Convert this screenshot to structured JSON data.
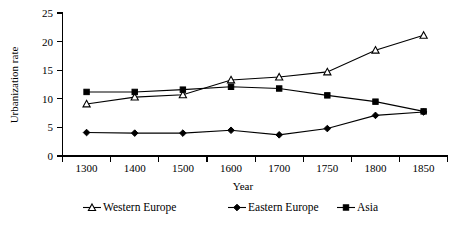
{
  "chart_data": {
    "type": "line",
    "title": "",
    "xlabel": "Year",
    "ylabel": "Urbanization rate",
    "categories": [
      "1300",
      "1400",
      "1500",
      "1600",
      "1700",
      "1750",
      "1800",
      "1850"
    ],
    "ylim": [
      0,
      25
    ],
    "yticks": [
      "0",
      "5",
      "10",
      "15",
      "20",
      "25"
    ],
    "grid": false,
    "legend_position": "bottom",
    "series": [
      {
        "name": "Western Europe",
        "marker": "open-triangle",
        "color": "#000000",
        "values": [
          9.1,
          10.3,
          10.7,
          13.3,
          13.8,
          14.7,
          18.5,
          21.1
        ]
      },
      {
        "name": "Eastern Europe",
        "marker": "filled-diamond",
        "color": "#000000",
        "values": [
          4.1,
          4.0,
          4.0,
          4.5,
          3.7,
          4.8,
          7.1,
          7.7
        ]
      },
      {
        "name": "Asia",
        "marker": "filled-square",
        "color": "#000000",
        "values": [
          11.2,
          11.2,
          11.6,
          12.1,
          11.8,
          10.6,
          9.5,
          7.8
        ]
      }
    ]
  },
  "legend": {
    "items": [
      {
        "label": "Western Europe",
        "marker": "open-triangle"
      },
      {
        "label": "Eastern Europe",
        "marker": "filled-diamond"
      },
      {
        "label": "Asia",
        "marker": "filled-square"
      }
    ]
  },
  "axes": {
    "y_title": "Urbanization rate",
    "x_title": "Year",
    "y_tick_labels": [
      "25",
      "20",
      "15",
      "10",
      "5",
      "0"
    ],
    "x_tick_labels": [
      "1300",
      "1400",
      "1500",
      "1600",
      "1700",
      "1750",
      "1800",
      "1850"
    ]
  }
}
